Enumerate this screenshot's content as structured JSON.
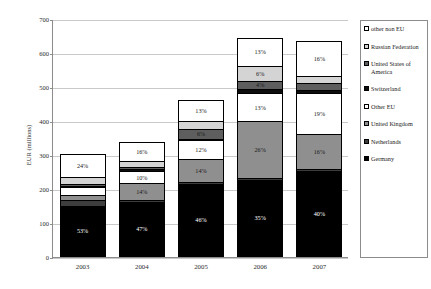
{
  "chart_data": {
    "type": "bar",
    "subtype": "stacked-bar-percent-labeled",
    "title": "",
    "xlabel": "",
    "ylabel": "EUR (millions)",
    "ylim": [
      0,
      700
    ],
    "ytick_step": 100,
    "ytick_labels": [
      "0",
      "100",
      "200",
      "300",
      "400",
      "500",
      "600",
      "700"
    ],
    "grid": true,
    "legend_position": "right",
    "categories": [
      "2003",
      "2004",
      "2005",
      "2006",
      "2007"
    ],
    "totals": [
      285,
      345,
      470,
      645,
      635
    ],
    "series": [
      {
        "name": "Germany",
        "color": "#000000",
        "text_on": "dark",
        "values": [
          151,
          162,
          216,
          226,
          254
        ],
        "labels": [
          "53%",
          "47%",
          "46%",
          "35%",
          "40%"
        ]
      },
      {
        "name": "Netherlands",
        "color": "#3d3d3d",
        "text_on": "dark",
        "values": [
          17,
          7,
          5,
          5,
          5
        ],
        "labels": [
          "6%",
          "2%",
          "1%",
          "1%",
          "1%"
        ]
      },
      {
        "name": "United Kingdom",
        "color": "#8f8f8f",
        "text_on": "light",
        "values": [
          14,
          48,
          66,
          168,
          102
        ],
        "labels": [
          "5%",
          "14%",
          "14%",
          "26%",
          "16%"
        ]
      },
      {
        "name": "Other EU",
        "color": "#ffffff",
        "text_on": "light",
        "values": [
          23,
          35,
          56,
          84,
          121
        ],
        "labels": [
          "8%",
          "10%",
          "12%",
          "13%",
          "19%"
        ]
      },
      {
        "name": "Switzerland",
        "color": "#0d0d0d",
        "text_on": "dark",
        "values": [
          5,
          7,
          5,
          10,
          10
        ],
        "labels": [
          "2%",
          "2%",
          "1%",
          "2%",
          "2%"
        ]
      },
      {
        "name": "United States of America",
        "color": "#5e5e5e",
        "text_on": "light",
        "values": [
          5,
          7,
          28,
          26,
          19
        ],
        "labels": [
          "2%",
          "2%",
          "6%",
          "4%",
          "3%"
        ]
      },
      {
        "name": "Russian Federation",
        "color": "#d4d4d4",
        "text_on": "light",
        "values": [
          20,
          17,
          24,
          42,
          22
        ],
        "labels": [
          "7%",
          "5%",
          "5%",
          "6%",
          "3%"
        ]
      },
      {
        "name": "other non EU",
        "color": "#ffffff",
        "text_on": "light",
        "values": [
          68,
          55,
          61,
          84,
          102
        ],
        "labels": [
          "24%",
          "16%",
          "13%",
          "13%",
          "16%"
        ]
      }
    ],
    "legend_order_top_to_bottom": [
      "other non EU",
      "Russian Federation",
      "United States of America",
      "Switzerland",
      "Other EU",
      "United Kingdom",
      "Netherlands",
      "Germany"
    ]
  }
}
